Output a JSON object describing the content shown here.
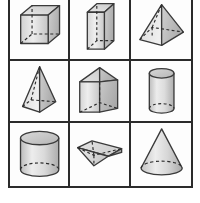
{
  "figure": {
    "rows": 3,
    "columns": 3,
    "background_color": "#ffffff",
    "grid_border_color": "#2b2b2b",
    "outline_color": "#3a3a3a",
    "hidden_edge_style": "dashed",
    "fill_light": "#e9e9e9",
    "fill_mid": "#cfcfcf",
    "fill_dark": "#b0b0b0"
  },
  "cells": [
    {
      "position": "row1-col1",
      "shape_name": "cube",
      "label": "Cube",
      "description": "Cube drawn in oblique projection with dashed hidden edges"
    },
    {
      "position": "row1-col2",
      "shape_name": "rectangular-prism",
      "label": "Rectangular Prism",
      "description": "Tall rectangular prism standing upright with dashed hidden vertical edge"
    },
    {
      "position": "row1-col3",
      "shape_name": "square-pyramid",
      "label": "Square Pyramid",
      "description": "Square pyramid with dashed hidden base edges"
    },
    {
      "position": "row2-col1",
      "shape_name": "tall-square-pyramid",
      "label": "Tall Square Pyramid",
      "description": "Narrow tall pyramid with dashed hidden back base edge"
    },
    {
      "position": "row2-col2",
      "shape_name": "triangular-prism-upright",
      "label": "Triangular Prism",
      "description": "Triangular prism standing upright with dashed hidden vertical and base edges"
    },
    {
      "position": "row2-col3",
      "shape_name": "cylinder-tall",
      "label": "Cylinder",
      "description": "Tall narrow cylinder with dashed hidden bottom ellipse"
    },
    {
      "position": "row3-col1",
      "shape_name": "cylinder-wide",
      "label": "Cylinder",
      "description": "Wide cylinder with dashed hidden bottom ellipse"
    },
    {
      "position": "row3-col2",
      "shape_name": "triangular-prism-lying",
      "label": "Triangular Prism",
      "description": "Triangular prism lying on its side with dashed hidden edges"
    },
    {
      "position": "row3-col3",
      "shape_name": "cone",
      "label": "Cone",
      "description": "Cone with dashed hidden base ellipse"
    }
  ]
}
